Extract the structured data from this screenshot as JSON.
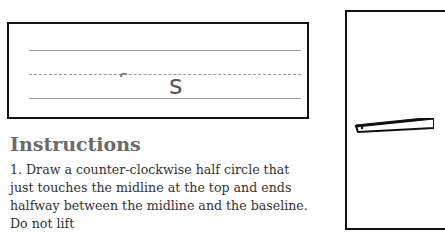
{
  "practice": {
    "letters": {
      "partial": "s",
      "full": "s"
    },
    "lines": [
      "top-line",
      "midline",
      "baseline"
    ]
  },
  "instructions": {
    "heading": "Instructions",
    "step1": "1. Draw a counter-clockwise half circle that just touches the midline at the top and ends halfway between the midline and the baseline. Do not lift"
  },
  "illustration": {
    "description": "hand holding pencil"
  }
}
